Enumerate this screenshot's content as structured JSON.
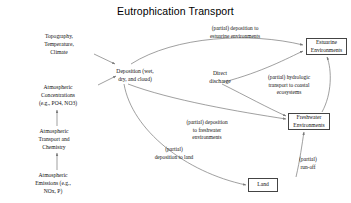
{
  "title": "Eutrophication Transport",
  "nodes": {
    "topography": {
      "label": "Topography,\nTemperature,\nClimate",
      "x": 22,
      "y": 33,
      "w": 74
    },
    "atmospheric_concentrations": {
      "label": "Atmospheric\nConcentrations\n(e.g., PO4, NO3)",
      "x": 18,
      "y": 84,
      "w": 80
    },
    "atmospheric_transport": {
      "label": "Atmospheric\nTransport and\nChemistry",
      "x": 16,
      "y": 128,
      "w": 76
    },
    "atmospheric_emissions": {
      "label": "Atmospheric\nEmissions (e.g.,\nNOx, P)",
      "x": 14,
      "y": 172,
      "w": 78
    },
    "deposition": {
      "label": "Deposition (wet,\ndry, and cloud)",
      "x": 98,
      "y": 68,
      "w": 74
    },
    "direct_discharge": {
      "label": "Direct\ndischarge",
      "x": 196,
      "y": 70,
      "w": 48
    },
    "estuarine": {
      "label": "Estuarine\nEnvironments",
      "x": 306,
      "y": 38,
      "w": 41,
      "h": 17
    },
    "freshwater": {
      "label": "Freshwater\nEnvironments",
      "x": 288,
      "y": 113,
      "w": 42,
      "h": 17
    },
    "land": {
      "label": "Land",
      "x": 248,
      "y": 178,
      "w": 30,
      "h": 14
    }
  },
  "edge_labels": {
    "deposition_estuarine": {
      "label": "(partial) deposition to\nestuarine environments",
      "x": 192,
      "y": 25,
      "w": 86
    },
    "hydrologic_transport": {
      "label": "(partial) hydrologic\ntransport to coastal\necosystems",
      "x": 252,
      "y": 74,
      "w": 74
    },
    "deposition_freshwater": {
      "label": "(partial) deposition\nto freshwater\nenvironments",
      "x": 172,
      "y": 119,
      "w": 70
    },
    "deposition_land": {
      "label": "(partial)\ndeposition to land",
      "x": 141,
      "y": 146,
      "w": 66
    },
    "runoff": {
      "label": "(partial)\nrun-off",
      "x": 288,
      "y": 156,
      "w": 40
    }
  },
  "colors": {
    "edge": "#777777",
    "box_border": "#444444",
    "text": "#111111",
    "background": "#ffffff"
  }
}
